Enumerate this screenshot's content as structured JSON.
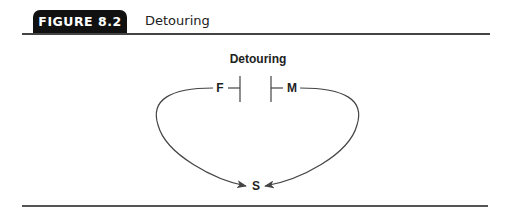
{
  "figure": {
    "label": "FIGURE 8.2",
    "title": "Detouring"
  },
  "diagram": {
    "title": "Detouring",
    "nodes": {
      "left": "F",
      "right": "M",
      "bottom": "S"
    },
    "colors": {
      "line": "#444444",
      "text": "#222222",
      "tab": "#111111"
    }
  }
}
